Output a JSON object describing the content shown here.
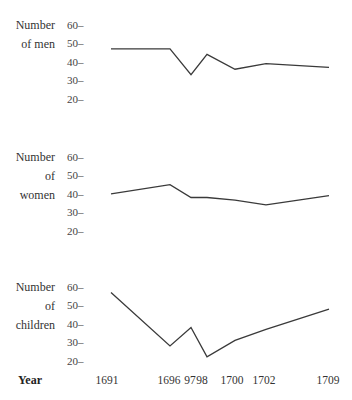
{
  "chart_data": {
    "type": "line",
    "title": "",
    "xlabel": "Year",
    "x": [
      1691,
      1696,
      1697,
      1698,
      1700,
      1702,
      1709
    ],
    "x_tick_labels": [
      "1691",
      "1696",
      "97",
      "98",
      "1700",
      "1702",
      "1709"
    ],
    "grid": false,
    "legend": null,
    "panels": [
      {
        "ylabel_lines": [
          "Number",
          "of men"
        ],
        "yticks": [
          "60",
          "50",
          "40",
          "30",
          "20"
        ],
        "ylim": [
          20,
          60
        ],
        "series": [
          {
            "name": "Number of men",
            "values": [
              47,
              47,
              33,
              44,
              36,
              39,
              37
            ]
          }
        ]
      },
      {
        "ylabel_lines": [
          "Number",
          "of",
          "women"
        ],
        "yticks": [
          "60",
          "50",
          "40",
          "30",
          "20"
        ],
        "ylim": [
          20,
          60
        ],
        "series": [
          {
            "name": "Number of women",
            "values": [
              40,
              45,
              38,
              38,
              36.5,
              34,
              39
            ]
          }
        ]
      },
      {
        "ylabel_lines": [
          "Number",
          "of",
          "children"
        ],
        "yticks": [
          "60",
          "50",
          "40",
          "30",
          "20"
        ],
        "ylim": [
          20,
          60
        ],
        "series": [
          {
            "name": "Number of children",
            "values": [
              57,
              28,
              38,
              22,
              31,
              37,
              48
            ]
          }
        ]
      }
    ]
  },
  "layout": {
    "x_pixels": [
      111,
      170,
      191,
      207,
      235,
      266,
      329
    ],
    "year_label_x": [
      107,
      169,
      190,
      202,
      232,
      264,
      328
    ],
    "panel_tick_y60": [
      25,
      157,
      287
    ],
    "px_per_unit": 1.84
  }
}
